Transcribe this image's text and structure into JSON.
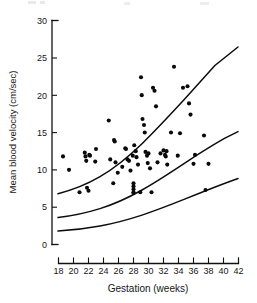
{
  "chart_data": {
    "type": "scatter",
    "title": "",
    "xlabel": "Gestation (weeks)",
    "ylabel": "Mean blood velocity (cm/sec)",
    "xlim": [
      18,
      42
    ],
    "ylim": [
      0,
      30
    ],
    "xticks": [
      18,
      20,
      22,
      24,
      26,
      28,
      30,
      32,
      34,
      36,
      38,
      40,
      42
    ],
    "yticks": [
      0,
      5,
      10,
      15,
      20,
      25,
      30
    ],
    "grid": false,
    "legend": null,
    "x": [
      18.6,
      19.4,
      20.8,
      21.5,
      21.6,
      21.7,
      21.8,
      22.0,
      22.1,
      22.2,
      22.9,
      23.0,
      24.7,
      24.9,
      25.3,
      25.4,
      25.5,
      25.6,
      25.9,
      26.5,
      26.9,
      27.0,
      27.2,
      27.4,
      27.6,
      27.9,
      28.0,
      28.0,
      28.0,
      28.0,
      28.0,
      28.1,
      28.3,
      28.4,
      28.6,
      28.9,
      29.0,
      29.1,
      29.2,
      29.4,
      29.5,
      29.6,
      29.8,
      29.9,
      30.0,
      30.2,
      30.4,
      30.6,
      30.8,
      31.0,
      31.2,
      31.6,
      32.0,
      32.2,
      32.3,
      32.4,
      32.5,
      33.0,
      33.4,
      33.9,
      34.2,
      34.6,
      35.2,
      35.4,
      35.6,
      36.0,
      36.2,
      37.4,
      37.6,
      38.0
    ],
    "y": [
      11.8,
      10.0,
      7.0,
      12.3,
      11.8,
      11.2,
      7.6,
      7.2,
      12.0,
      11.9,
      11.1,
      12.8,
      16.6,
      11.4,
      8.2,
      14.0,
      13.8,
      11.0,
      9.6,
      10.4,
      12.9,
      12.8,
      11.4,
      11.2,
      9.9,
      11.9,
      8.2,
      7.8,
      7.4,
      7.0,
      6.9,
      13.3,
      12.5,
      11.7,
      10.7,
      7.0,
      22.4,
      20.0,
      16.8,
      16.0,
      15.0,
      12.4,
      11.9,
      10.9,
      12.2,
      10.2,
      7.0,
      21.0,
      20.6,
      18.5,
      11.0,
      12.2,
      12.6,
      12.0,
      11.8,
      12.5,
      10.7,
      15.0,
      23.8,
      11.9,
      14.9,
      21.0,
      21.2,
      18.9,
      17.4,
      10.8,
      12.0,
      14.6,
      7.3,
      10.8
    ],
    "curves": [
      {
        "name": "upper-percentile-curve",
        "points": [
          [
            18.0,
            6.8
          ],
          [
            20.0,
            7.6
          ],
          [
            22.0,
            8.6
          ],
          [
            24.0,
            9.9
          ],
          [
            26.0,
            11.5
          ],
          [
            28.0,
            13.4
          ],
          [
            30.0,
            15.6
          ],
          [
            32.0,
            18.0
          ],
          [
            34.0,
            20.5
          ],
          [
            36.0,
            22.8
          ],
          [
            38.0,
            24.4
          ],
          [
            39.2,
            25.4
          ]
        ]
      },
      {
        "name": "median-curve",
        "points": [
          [
            18.0,
            3.6
          ],
          [
            20.0,
            4.0
          ],
          [
            22.0,
            4.6
          ],
          [
            24.0,
            5.4
          ],
          [
            26.0,
            6.4
          ],
          [
            28.0,
            7.6
          ],
          [
            30.0,
            9.0
          ],
          [
            32.0,
            10.4
          ],
          [
            34.0,
            11.8
          ],
          [
            36.0,
            13.0
          ],
          [
            38.0,
            14.1
          ],
          [
            39.8,
            14.8
          ]
        ]
      },
      {
        "name": "lower-percentile-curve",
        "points": [
          [
            18.0,
            1.8
          ],
          [
            20.0,
            2.0
          ],
          [
            22.0,
            2.4
          ],
          [
            24.0,
            2.9
          ],
          [
            26.0,
            3.5
          ],
          [
            28.0,
            4.3
          ],
          [
            30.0,
            5.2
          ],
          [
            32.0,
            6.1
          ],
          [
            34.0,
            7.0
          ],
          [
            36.0,
            7.9
          ],
          [
            38.0,
            8.7
          ],
          [
            40.0,
            9.4
          ]
        ]
      }
    ]
  },
  "axes": {
    "x_tick_labels": [
      "18",
      "20",
      "22",
      "24",
      "26",
      "28",
      "30",
      "32",
      "34",
      "36",
      "38",
      "40",
      "42"
    ],
    "y_tick_labels": [
      "0",
      "5",
      "10",
      "15",
      "20",
      "25",
      "30"
    ],
    "x_axis_title": "Gestation (weeks)",
    "y_axis_title": "Mean blood velocity (cm/sec)"
  },
  "colors": {
    "ink": "#111111",
    "dot": "#0a0a0a",
    "background": "#ffffff"
  }
}
